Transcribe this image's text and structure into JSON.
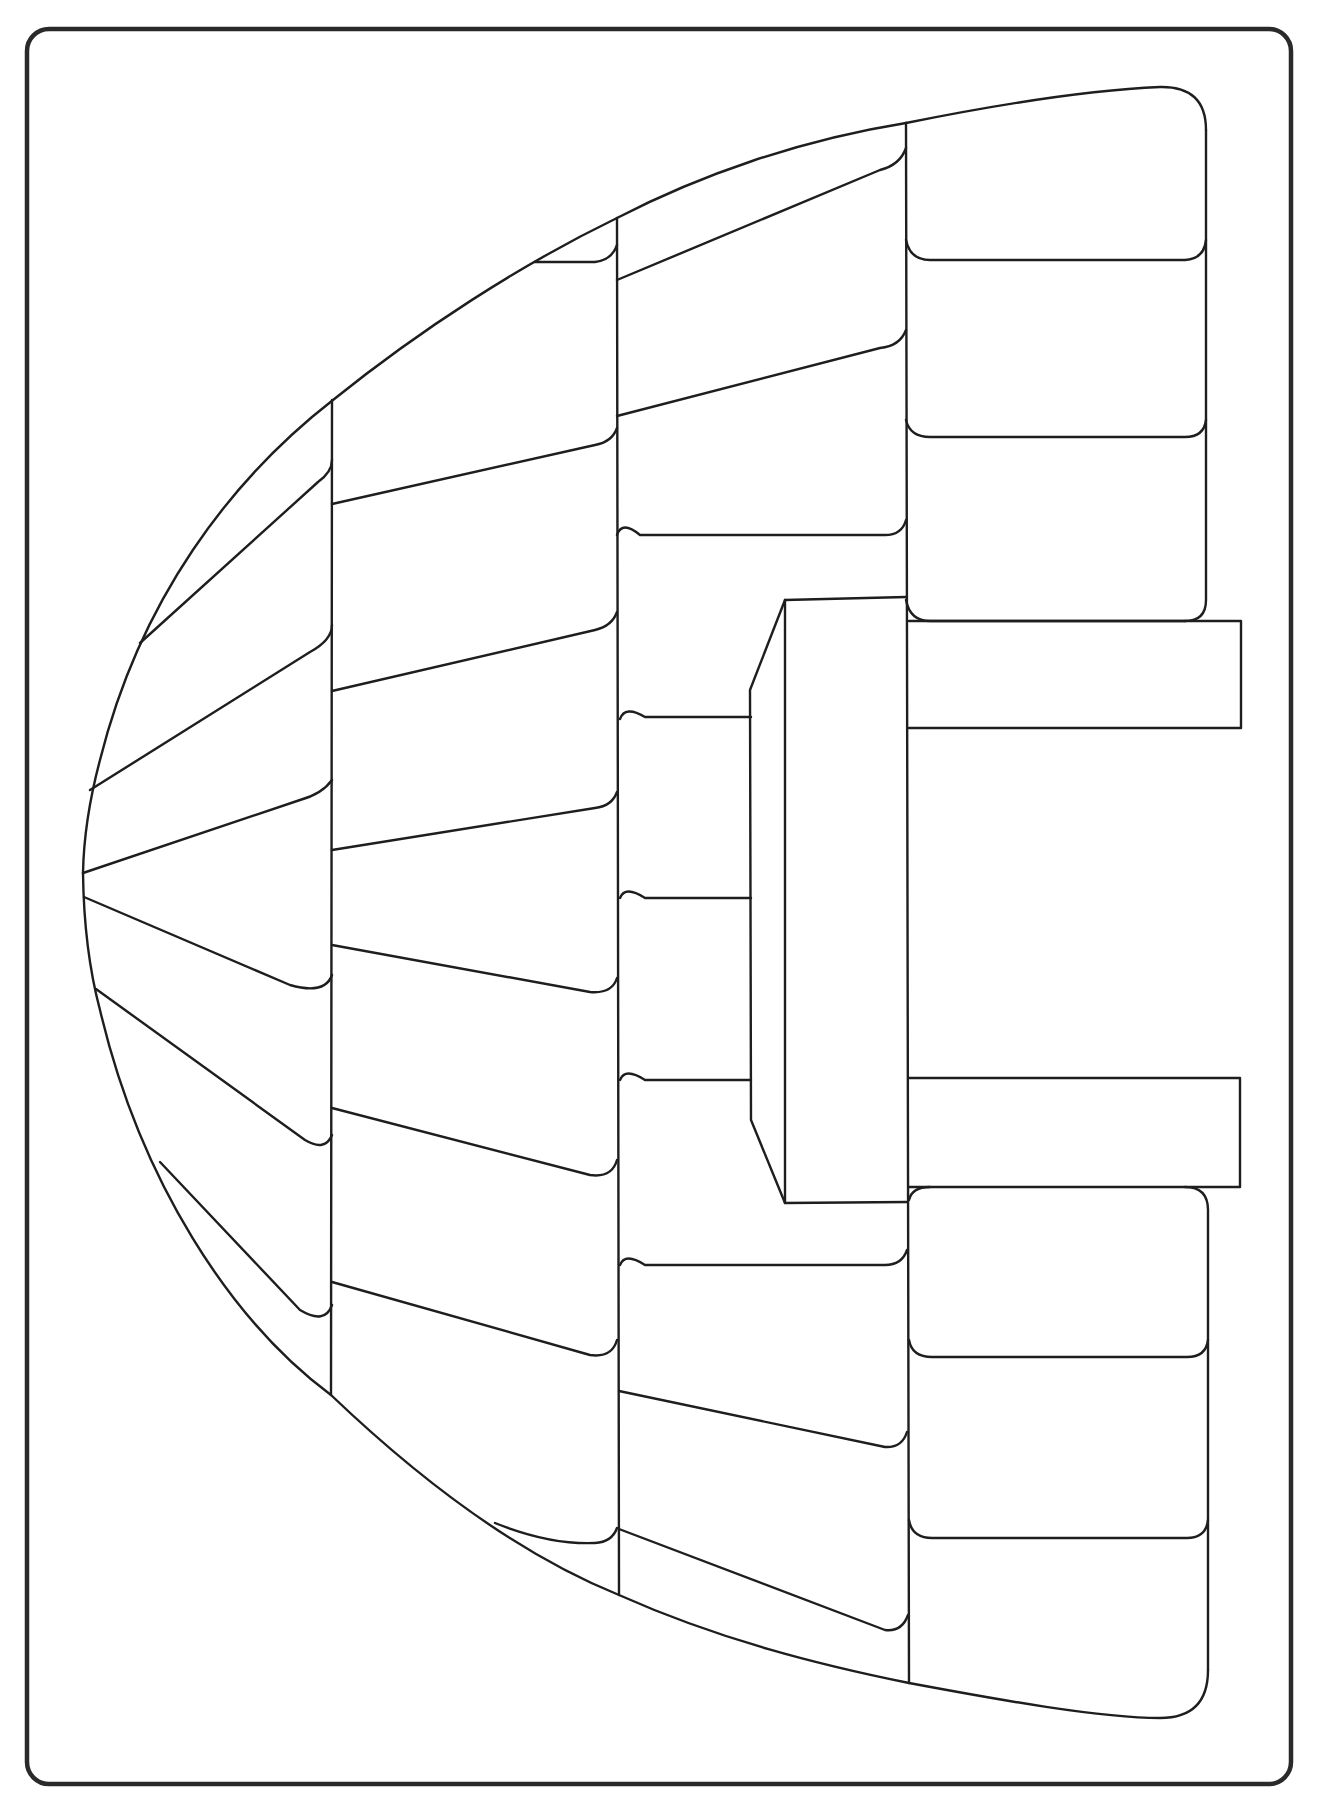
{
  "colors": {
    "background": "#ffffff",
    "line": "#1e1e1e",
    "frame": "#2a2a2a"
  },
  "drawing": {
    "subject": "igloo",
    "block_columns": 4,
    "entrance": "rectangular tunnel with two horizontal bars"
  }
}
